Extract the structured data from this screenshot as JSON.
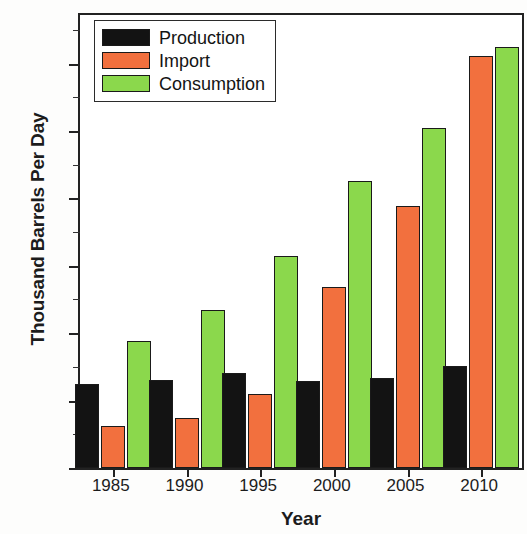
{
  "chart_data": {
    "type": "bar",
    "title": "",
    "xlabel": "Year",
    "ylabel": "Thousand Barrels Per Day",
    "categories": [
      "1985",
      "1990",
      "1995",
      "2000",
      "2005",
      "2010"
    ],
    "series": [
      {
        "name": "Production",
        "color": "#131313",
        "values": [
          620,
          655,
          705,
          645,
          670,
          760
        ]
      },
      {
        "name": "Import",
        "color": "#f2703e",
        "values": [
          310,
          370,
          550,
          1345,
          1945,
          3055
        ]
      },
      {
        "name": "Consumption",
        "color": "#8bd84c",
        "values": [
          945,
          1170,
          1570,
          2130,
          2520,
          3120
        ]
      }
    ],
    "ylim": [
      0,
      3360
    ],
    "yticks": [
      0,
      500,
      1000,
      1500,
      2000,
      2500,
      3000
    ],
    "ytick_labels": [
      "0",
      "500",
      "1000",
      "1500",
      "2000",
      "2500",
      "3000"
    ],
    "yminor_ticks": [
      250,
      750,
      1250,
      1750,
      2250,
      2750,
      3250
    ],
    "grid": false,
    "legend_position": "top-left",
    "legend_entries": [
      "Production",
      "Import",
      "Consumption"
    ]
  }
}
